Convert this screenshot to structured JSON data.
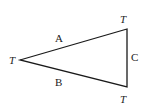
{
  "diagram": {
    "type": "triangle",
    "stroke_color": "#1a1a1a",
    "vertices": [
      {
        "id": "left",
        "x": 20,
        "y": 60,
        "label": "T",
        "label_x": 9,
        "label_y": 64
      },
      {
        "id": "top_right",
        "x": 127,
        "y": 29,
        "label": "T",
        "label_x": 120,
        "label_y": 23
      },
      {
        "id": "bottom_right",
        "x": 127,
        "y": 87,
        "label": "T",
        "label_x": 120,
        "label_y": 103
      }
    ],
    "edges": [
      {
        "id": "A",
        "label": "A",
        "label_x": 55,
        "label_y": 42
      },
      {
        "id": "B",
        "label": "B",
        "label_x": 55,
        "label_y": 86
      },
      {
        "id": "C",
        "label": "C",
        "label_x": 131,
        "label_y": 61
      }
    ]
  }
}
